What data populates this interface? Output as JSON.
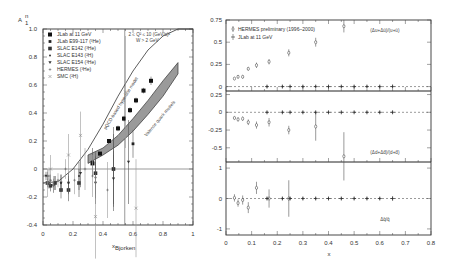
{
  "chart_data": [
    {
      "type": "scatter",
      "title": "",
      "ylabel": "A1^n",
      "xlabel": "x_Bjorken",
      "xlim": [
        0,
        1
      ],
      "ylim": [
        -0.4,
        1.0
      ],
      "xticks": [
        "0",
        "0.2",
        "0.4",
        "0.6",
        "0.8",
        "1"
      ],
      "yticks": [
        "-0.4",
        "-0.2",
        "0",
        "0.2",
        "0.4",
        "0.6",
        "0.8",
        "1.0"
      ],
      "annotations": [
        "2 ≤ Q² ≤ 10 (GeV/c)²",
        "W > 2 GeV",
        "pQCD-based hyperfine model",
        "Valence quark models"
      ],
      "legend": [
        "JLab at 11 GeV",
        "JLab E99-117 (³He)",
        "SLAC E142 (³He)",
        "SLAC E143 (²H)",
        "SLAC E154 (³He)",
        "HERMES (³He)",
        "SMC (²H)"
      ],
      "series": [
        {
          "name": "JLab at 11 GeV",
          "x": [
            0.33,
            0.38,
            0.44,
            0.5,
            0.54,
            0.58,
            0.62,
            0.67,
            0.72
          ],
          "y": [
            0.04,
            0.11,
            0.2,
            0.29,
            0.36,
            0.42,
            0.49,
            0.56,
            0.63
          ],
          "err": [
            0.01,
            0.01,
            0.01,
            0.02,
            0.02,
            0.02,
            0.02,
            0.02,
            0.03
          ]
        },
        {
          "name": "JLab E99-117 (³He)",
          "x": [
            0.33,
            0.47,
            0.6
          ],
          "y": [
            0.05,
            0.0,
            0.18
          ],
          "err": [
            0.1,
            0.1,
            0.1
          ]
        },
        {
          "name": "SLAC E142 (³He)",
          "x": [
            0.03,
            0.05,
            0.08,
            0.12,
            0.17,
            0.24,
            0.35,
            0.47
          ],
          "y": [
            -0.1,
            -0.12,
            -0.1,
            -0.15,
            -0.15,
            -0.1,
            -0.03,
            0.0
          ],
          "err": [
            0.03,
            0.04,
            0.05,
            0.06,
            0.08,
            0.1,
            0.15,
            0.3
          ]
        },
        {
          "name": "SLAC E143 (²H)",
          "x": [
            0.03,
            0.05,
            0.08,
            0.12,
            0.17,
            0.24,
            0.35,
            0.47
          ],
          "y": [
            -0.05,
            -0.08,
            -0.1,
            -0.1,
            -0.1,
            -0.05,
            -0.06,
            0.0
          ],
          "err": [
            0.03,
            0.04,
            0.05,
            0.06,
            0.07,
            0.1,
            0.15,
            0.25
          ]
        },
        {
          "name": "SLAC E154 (³He)",
          "x": [
            0.02,
            0.04,
            0.07,
            0.12,
            0.17,
            0.25,
            0.35,
            0.47,
            0.57
          ],
          "y": [
            -0.05,
            -0.1,
            -0.12,
            -0.1,
            -0.1,
            -0.03,
            -0.1,
            -0.07,
            0.05
          ],
          "err": [
            0.03,
            0.04,
            0.05,
            0.06,
            0.08,
            0.1,
            0.15,
            0.2,
            0.3
          ]
        },
        {
          "name": "HERMES (³He)",
          "x": [
            0.04,
            0.07,
            0.1,
            0.15,
            0.21,
            0.28,
            0.33,
            0.43
          ],
          "y": [
            -0.05,
            -0.1,
            -0.08,
            0.0,
            -0.08,
            0.0,
            -0.05,
            -0.15
          ],
          "err": [
            0.05,
            0.05,
            0.05,
            0.07,
            0.1,
            0.15,
            0.15,
            0.2
          ]
        },
        {
          "name": "SMC (²H)",
          "x": [
            0.03,
            0.05,
            0.17,
            0.25,
            0.35,
            0.55,
            0.62
          ],
          "y": [
            -0.1,
            0.0,
            0.1,
            0.24,
            -0.34,
            0.55,
            -0.28
          ],
          "err": [
            0.1,
            0.1,
            0.15,
            0.17,
            0.3,
            0.4,
            0.35
          ]
        }
      ],
      "curves": [
        {
          "name": "pQCD-based hyperfine model",
          "x": [
            0.0,
            0.1,
            0.2,
            0.3,
            0.4,
            0.5,
            0.6,
            0.7,
            0.8,
            0.9,
            1.0
          ],
          "y": [
            -0.1,
            -0.09,
            0.0,
            0.14,
            0.32,
            0.52,
            0.7,
            0.85,
            0.95,
            1.0,
            1.0
          ]
        },
        {
          "name": "Valence quark models (band)",
          "x": [
            0.3,
            0.4,
            0.5,
            0.6,
            0.7,
            0.8,
            0.9
          ],
          "y_low": [
            0.04,
            0.1,
            0.17,
            0.27,
            0.39,
            0.52,
            0.68
          ],
          "y_high": [
            0.1,
            0.15,
            0.24,
            0.36,
            0.49,
            0.63,
            0.76
          ]
        }
      ]
    },
    {
      "type": "scatter",
      "title": "",
      "xlabel": "x",
      "xlim": [
        0,
        0.8
      ],
      "xticks": [
        "0",
        "0.1",
        "0.2",
        "0.3",
        "0.4",
        "0.5",
        "0.6",
        "0.7",
        "0.8"
      ],
      "legend": [
        "HERMES preliminary (1996–2000)",
        "JLab at 11 GeV"
      ],
      "panels": [
        {
          "label": "(Δu+Δū)/(u+ū)",
          "ylim": [
            -0.05,
            0.75
          ],
          "yticks": [
            "0",
            "0.25",
            "0.5",
            "0.75"
          ],
          "series": [
            {
              "name": "HERMES preliminary (1996–2000)",
              "x": [
                0.033,
                0.047,
                0.065,
                0.087,
                0.119,
                0.168,
                0.245,
                0.35,
                0.46
              ],
              "y": [
                0.09,
                0.11,
                0.11,
                0.2,
                0.24,
                0.28,
                0.38,
                0.5,
                0.68
              ],
              "err": [
                0.01,
                0.02,
                0.02,
                0.02,
                0.03,
                0.03,
                0.04,
                0.05,
                0.07
              ]
            },
            {
              "name": "JLab at 11 GeV",
              "x": [
                0.16,
                0.22,
                0.25,
                0.3,
                0.35,
                0.4,
                0.45,
                0.5,
                0.55,
                0.6,
                0.65
              ],
              "y": [
                0,
                0,
                0,
                0,
                0,
                0,
                0,
                0,
                0,
                0,
                0
              ],
              "err": [
                0.015,
                0.015,
                0.015,
                0.015,
                0.015,
                0.015,
                0.015,
                0.015,
                0.015,
                0.015,
                0.02
              ]
            }
          ]
        },
        {
          "label": "(Δd+Δd̄)/(d+d̄)",
          "ylim": [
            -0.7,
            0.3
          ],
          "yticks": [
            "-0.5",
            "-0.25",
            "0",
            "0.25"
          ],
          "series": [
            {
              "name": "HERMES preliminary (1996–2000)",
              "x": [
                0.033,
                0.047,
                0.065,
                0.087,
                0.119,
                0.168,
                0.245,
                0.35,
                0.46
              ],
              "y": [
                -0.08,
                -0.1,
                -0.09,
                -0.14,
                -0.18,
                -0.14,
                -0.25,
                -0.2,
                -0.62
              ],
              "err": [
                0.02,
                0.03,
                0.03,
                0.04,
                0.05,
                0.06,
                0.06,
                0.2,
                0.34
              ]
            },
            {
              "name": "JLab at 11 GeV",
              "x": [
                0.16,
                0.22,
                0.25,
                0.3,
                0.35,
                0.4,
                0.45,
                0.5,
                0.55,
                0.6,
                0.65
              ],
              "y": [
                0,
                0,
                0,
                0,
                0,
                0,
                0,
                0,
                0,
                0,
                0
              ],
              "err": [
                0.015,
                0.015,
                0.015,
                0.015,
                0.015,
                0.015,
                0.015,
                0.015,
                0.015,
                0.015,
                0.02
              ]
            }
          ]
        },
        {
          "label": "Δq̄/q̄",
          "ylim": [
            -1.2,
            1.2
          ],
          "yticks": [
            "-1",
            "0",
            "1"
          ],
          "series": [
            {
              "name": "HERMES preliminary (1996–2000)",
              "x": [
                0.033,
                0.047,
                0.065,
                0.087,
                0.119,
                0.168,
                0.245
              ],
              "y": [
                0.02,
                -0.15,
                -0.05,
                -0.3,
                0.35,
                0.0,
                0.0
              ],
              "err": [
                0.12,
                0.12,
                0.15,
                0.18,
                0.2,
                0.3,
                0.6
              ]
            },
            {
              "name": "JLab at 11 GeV",
              "x": [
                0.16,
                0.22,
                0.25,
                0.3,
                0.35,
                0.4,
                0.45,
                0.5,
                0.55,
                0.6,
                0.65
              ],
              "y": [
                0,
                0,
                0,
                0,
                0,
                0,
                0,
                0,
                0,
                0,
                0
              ],
              "err": [
                0.05,
                0.05,
                0.05,
                0.05,
                0.05,
                0.05,
                0.05,
                0.05,
                0.05,
                0.05,
                0.07
              ]
            }
          ]
        }
      ]
    }
  ],
  "left": {
    "ylabel": "A",
    "ylabel_sub": "1",
    "ylabel_sup": "n",
    "xlabel": "x",
    "xlabel_sub": "Bjorken",
    "kin1": "2 ≤ Q² ≤ 10 (GeV/c)²",
    "kin2": "W > 2 GeV",
    "curve_label": "pQCD-based hyperfine model",
    "band_label": "Valence quark models"
  },
  "right": {
    "xlabel": "x",
    "legend1": "HERMES preliminary (1996–2000)",
    "legend2": "JLab at 11 GeV"
  }
}
